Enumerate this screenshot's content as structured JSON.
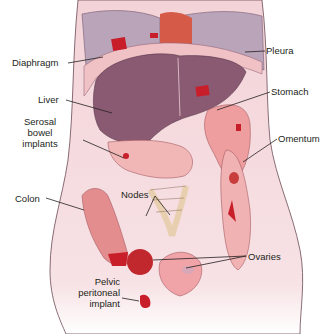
{
  "figure": {
    "colors": {
      "body_skin": "#f6dde0",
      "lung_pleura": "#b8a3b8",
      "liver": "#8a5a72",
      "stomach": "#e8a7a4",
      "colon": "#e48d8e",
      "tumor_implant": "#c81e2a",
      "heart": "#d65a48",
      "label_text": "#231f20",
      "leader_line": "#231f20"
    }
  },
  "labels": {
    "diaphragm": "Diaphragm",
    "pleura": "Pleura",
    "liver": "Liver",
    "stomach": "Stomach",
    "serosal_1": "Serosal",
    "serosal_2": "bowel",
    "serosal_3": "implants",
    "omentum": "Omentum",
    "colon": "Colon",
    "nodes": "Nodes",
    "ovaries": "Ovaries",
    "pelvic_1": "Pelvic",
    "pelvic_2": "peritoneal",
    "pelvic_3": "implant"
  }
}
